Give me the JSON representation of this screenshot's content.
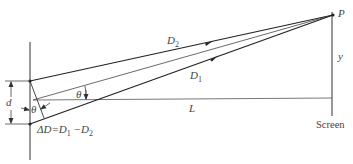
{
  "diagram": {
    "type": "double-slit interference geometry",
    "labels": {
      "point": "P",
      "path_upper": "D",
      "path_upper_sub": "2",
      "path_lower": "D",
      "path_lower_sub": "1",
      "vertical_offset": "y",
      "distance": "L",
      "slit_separation": "d",
      "angle_center": "θ",
      "angle_slit": "θ",
      "path_difference": "ΔD=D",
      "path_difference_sub1": "1",
      "path_difference_mid": " −D",
      "path_difference_sub2": "2",
      "screen": "Screen"
    },
    "colors": {
      "line": "#333333",
      "text": "#444444",
      "background": "#ffffff"
    }
  }
}
